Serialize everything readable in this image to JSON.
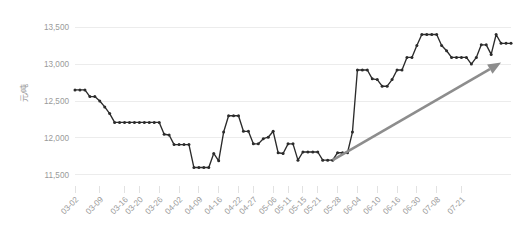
{
  "chart_data": {
    "type": "line",
    "title": "",
    "subtitle": "",
    "xlabel": "",
    "ylabel": "元/吨",
    "ylim": [
      11350,
      13650
    ],
    "yticks": [
      11500,
      12000,
      12500,
      13000,
      13500
    ],
    "ytick_labels": [
      "11,500",
      "12,000",
      "12,500",
      "13,000",
      "13,500"
    ],
    "grid": true,
    "grid_axis": "y",
    "legend": false,
    "legend_position": "none",
    "marker": "circle",
    "line_color": "#2b2b2b",
    "grid_color": "#ececec",
    "tick_label_color": "#9a9a9a",
    "xtick_labels": [
      "03-02",
      "03-09",
      "03-16",
      "03-20",
      "03-26",
      "04-02",
      "04-09",
      "04-16",
      "04-22",
      "04-27",
      "05-06",
      "05-11",
      "05-15",
      "05-21",
      "05-28",
      "06-04",
      "06-10",
      "06-16",
      "06-30",
      "07-08",
      "07-21"
    ],
    "xtick_indices": [
      0,
      5,
      10,
      13,
      17,
      21,
      25,
      29,
      33,
      36,
      40,
      43,
      46,
      49,
      53,
      57,
      61,
      65,
      69,
      73,
      78
    ],
    "series": [
      {
        "name": "价格",
        "values": [
          12650,
          12650,
          12650,
          12560,
          12560,
          12500,
          12420,
          12330,
          12210,
          12210,
          12210,
          12210,
          12210,
          12210,
          12210,
          12210,
          12210,
          12210,
          12050,
          12040,
          11910,
          11910,
          11910,
          11910,
          11600,
          11600,
          11600,
          11600,
          11790,
          11690,
          12080,
          12300,
          12300,
          12300,
          12090,
          12090,
          11920,
          11920,
          11990,
          12010,
          12090,
          11800,
          11790,
          11920,
          11920,
          11700,
          11810,
          11810,
          11810,
          11810,
          11700,
          11700,
          11700,
          11800,
          11800,
          11800,
          12080,
          12920,
          12920,
          12920,
          12800,
          12790,
          12700,
          12700,
          12790,
          12920,
          12920,
          13090,
          13090,
          13250,
          13400,
          13400,
          13400,
          13400,
          13250,
          13180,
          13090,
          13090,
          13090,
          13090,
          13000,
          13090,
          13260,
          13260,
          13130,
          13400,
          13280,
          13280,
          13280
        ]
      }
    ],
    "annotations": [
      {
        "type": "arrow",
        "name": "uptrend-arrow",
        "color": "#8d8d8d",
        "from_index": 52,
        "to_index": 86,
        "from_value": 11700,
        "to_value": 13020,
        "description": "gray upward trend arrow"
      }
    ]
  }
}
